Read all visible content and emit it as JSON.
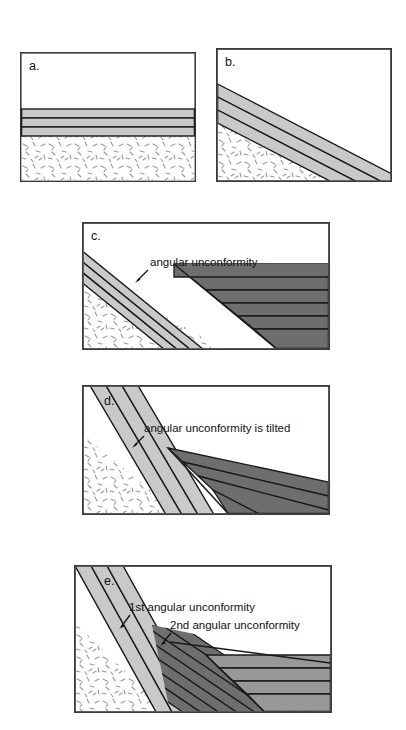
{
  "figure": {
    "background_color": "#ffffff"
  },
  "colors": {
    "frame_stroke": "#3a3a3a",
    "bed_line": "#1a1a1a",
    "unit_light_gray": "#c9c9c9",
    "unit_medium_gray": "#989898",
    "unit_dark_gray": "#6e6e6e",
    "basement_fill": "#ffffff",
    "stipple_stroke": "#9a9a9a",
    "text": "#111111"
  },
  "panels": [
    {
      "id": "a",
      "caption": "a.",
      "description": "Horizontal sedimentary beds deposited on crystalline basement",
      "annotations": []
    },
    {
      "id": "b",
      "caption": "b.",
      "description": "Beds tilted by tectonic deformation and eroded",
      "annotations": []
    },
    {
      "id": "c",
      "caption": "c.",
      "description": "New horizontal beds deposited over tilted beds forming an angular unconformity",
      "annotations": [
        {
          "text": "angular unconformity",
          "arrow": "down-left"
        }
      ]
    },
    {
      "id": "d",
      "caption": "d.",
      "description": "The entire sequence is tilted, tilting the angular unconformity",
      "annotations": [
        {
          "text": "angular unconformity is tilted",
          "arrow": "down-left"
        }
      ]
    },
    {
      "id": "e",
      "caption": "e.",
      "description": "Second set of horizontal beds deposited creating a second angular unconformity",
      "annotations": [
        {
          "text": "1st angular unconformity",
          "arrow": "down-left"
        },
        {
          "text": "2nd angular unconformity",
          "arrow": "down-left"
        }
      ]
    }
  ]
}
